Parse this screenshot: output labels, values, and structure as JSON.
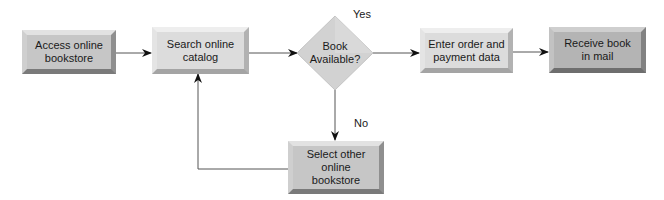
{
  "diagram": {
    "type": "flowchart",
    "nodes": [
      {
        "id": "access",
        "shape": "process",
        "label": "Access online bookstore",
        "lines": [
          "Access online",
          "bookstore"
        ]
      },
      {
        "id": "search",
        "shape": "process",
        "label": "Search online catalog",
        "lines": [
          "Search online",
          "catalog"
        ]
      },
      {
        "id": "decision",
        "shape": "decision",
        "label": "Book Available?",
        "lines": [
          "Book",
          "Available?"
        ]
      },
      {
        "id": "order",
        "shape": "process",
        "label": "Enter order and payment data",
        "lines": [
          "Enter order and",
          "payment data"
        ]
      },
      {
        "id": "receive",
        "shape": "process",
        "label": "Receive book in mail",
        "lines": [
          "Receive book",
          "in mail"
        ]
      },
      {
        "id": "select",
        "shape": "process",
        "label": "Select other online bookstore",
        "lines": [
          "Select other",
          "online",
          "bookstore"
        ]
      }
    ],
    "edges": [
      {
        "from": "access",
        "to": "search",
        "label": ""
      },
      {
        "from": "search",
        "to": "decision",
        "label": ""
      },
      {
        "from": "decision",
        "to": "order",
        "label": "Yes"
      },
      {
        "from": "order",
        "to": "receive",
        "label": ""
      },
      {
        "from": "decision",
        "to": "select",
        "label": "No"
      },
      {
        "from": "select",
        "to": "search",
        "label": ""
      }
    ],
    "edge_labels": {
      "yes": "Yes",
      "no": "No"
    },
    "colors": {
      "box_light": "#dcdcdc",
      "box_mid": "#c6c6c6",
      "box_dark": "#b4b4b4",
      "line": "#555555",
      "arrow": "#111111"
    }
  }
}
